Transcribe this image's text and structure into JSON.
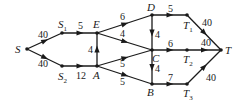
{
  "diagram": {
    "type": "flow-network",
    "nodes": [
      {
        "id": "S",
        "label": "S",
        "sub": "",
        "x": 27,
        "y": 49,
        "lx": 15,
        "ly": 53
      },
      {
        "id": "S1",
        "label": "S",
        "sub": "1",
        "x": 62,
        "y": 33,
        "lx": 58,
        "ly": 28
      },
      {
        "id": "E",
        "label": "E",
        "sub": "",
        "x": 97,
        "y": 33,
        "lx": 93,
        "ly": 28
      },
      {
        "id": "S2",
        "label": "S",
        "sub": "2",
        "x": 62,
        "y": 66,
        "lx": 58,
        "ly": 80
      },
      {
        "id": "A",
        "label": "A",
        "sub": "",
        "x": 97,
        "y": 66,
        "lx": 93,
        "ly": 79
      },
      {
        "id": "D",
        "label": "D",
        "sub": "",
        "x": 152,
        "y": 15,
        "lx": 147,
        "ly": 11
      },
      {
        "id": "C",
        "label": "C",
        "sub": "",
        "x": 152,
        "y": 50,
        "lx": 152,
        "ly": 62
      },
      {
        "id": "B",
        "label": "B",
        "sub": "",
        "x": 152,
        "y": 84,
        "lx": 147,
        "ly": 96
      },
      {
        "id": "T1",
        "label": "T",
        "sub": "1",
        "x": 187,
        "y": 15,
        "lx": 183,
        "ly": 29
      },
      {
        "id": "T2",
        "label": "T",
        "sub": "2",
        "x": 187,
        "y": 50,
        "lx": 183,
        "ly": 63
      },
      {
        "id": "T3",
        "label": "T",
        "sub": "3",
        "x": 187,
        "y": 84,
        "lx": 183,
        "ly": 97
      },
      {
        "id": "T",
        "label": "T",
        "sub": "",
        "x": 221,
        "y": 50,
        "lx": 225,
        "ly": 54
      }
    ],
    "edges": [
      {
        "from": "S",
        "to": "S1",
        "capacity": "40",
        "lx": 38,
        "ly": 38
      },
      {
        "from": "S",
        "to": "S2",
        "capacity": "40",
        "lx": 38,
        "ly": 67
      },
      {
        "from": "S1",
        "to": "E",
        "capacity": "5",
        "lx": 78,
        "ly": 29
      },
      {
        "from": "S2",
        "to": "A",
        "capacity": "12",
        "lx": 76,
        "ly": 79
      },
      {
        "from": "A",
        "to": "E",
        "capacity": "4",
        "lx": 88,
        "ly": 53
      },
      {
        "from": "E",
        "to": "D",
        "capacity": "6",
        "lx": 120,
        "ly": 20
      },
      {
        "from": "E",
        "to": "C",
        "capacity": "4",
        "lx": 120,
        "ly": 37
      },
      {
        "from": "A",
        "to": "C",
        "capacity": "5",
        "lx": 120,
        "ly": 67
      },
      {
        "from": "A",
        "to": "B",
        "capacity": "5",
        "lx": 120,
        "ly": 85
      },
      {
        "from": "D",
        "to": "C",
        "capacity": "4",
        "lx": 155,
        "ly": 38
      },
      {
        "from": "C",
        "to": "B",
        "capacity": "4",
        "lx": 155,
        "ly": 72
      },
      {
        "from": "D",
        "to": "T1",
        "capacity": "5",
        "lx": 168,
        "ly": 12
      },
      {
        "from": "C",
        "to": "T2",
        "capacity": "6",
        "lx": 168,
        "ly": 47
      },
      {
        "from": "B",
        "to": "T3",
        "capacity": "7",
        "lx": 168,
        "ly": 81
      },
      {
        "from": "T1",
        "to": "T",
        "capacity": "40",
        "lx": 202,
        "ly": 26
      },
      {
        "from": "T2",
        "to": "T",
        "capacity": "40",
        "lx": 201,
        "ly": 46
      },
      {
        "from": "T3",
        "to": "T",
        "capacity": "40",
        "lx": 206,
        "ly": 81
      }
    ]
  }
}
